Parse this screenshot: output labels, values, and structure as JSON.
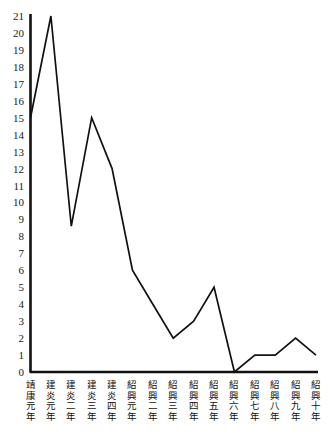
{
  "chart_data": {
    "type": "line",
    "title": "",
    "subtitle": "",
    "xlabel": "",
    "ylabel": "",
    "categories": [
      "靖康元年",
      "建炎元年",
      "建炎二年",
      "建炎三年",
      "建炎四年",
      "紹興元年",
      "紹興二年",
      "紹興三年",
      "紹興四年",
      "紹興五年",
      "紹興六年",
      "紹興七年",
      "紹興八年",
      "紹興九年",
      "紹興十年"
    ],
    "values": [
      15,
      21,
      8.6,
      15,
      12,
      6,
      4,
      2,
      3,
      5,
      0,
      1,
      1,
      2,
      1
    ],
    "ylim": [
      0,
      21
    ],
    "yticks": [
      0,
      1,
      2,
      3,
      4,
      5,
      6,
      7,
      8,
      9,
      10,
      11,
      12,
      13,
      14,
      15,
      16,
      17,
      18,
      19,
      20,
      21
    ],
    "ytick_labels": [
      "0",
      "1",
      "2",
      "3",
      "4",
      "5",
      "6",
      "7",
      "8",
      "9",
      "10",
      "11",
      "12",
      "13",
      "14",
      "15",
      "16",
      "17",
      "18",
      "19",
      "20",
      "21"
    ],
    "grid": false,
    "legend": null,
    "legend_position": "none",
    "series": [
      {
        "name": "",
        "values": [
          15,
          21,
          8.6,
          15,
          12,
          6,
          4,
          2,
          3,
          5,
          0,
          1,
          1,
          2,
          1
        ],
        "color": "#111111"
      }
    ],
    "axis_color": "#111111",
    "background_color": "#ffffff"
  }
}
